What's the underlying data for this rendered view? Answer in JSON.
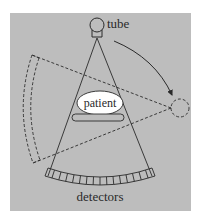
{
  "diagram": {
    "labels": {
      "tube": "tube",
      "patient": "patient",
      "detectors": "detectors"
    },
    "colors": {
      "background": "#ffffff",
      "panel": "#bdbdbd",
      "stroke": "#2a2a2a",
      "patient_fill": "#ffffff"
    },
    "detector_cell_count": 16
  }
}
